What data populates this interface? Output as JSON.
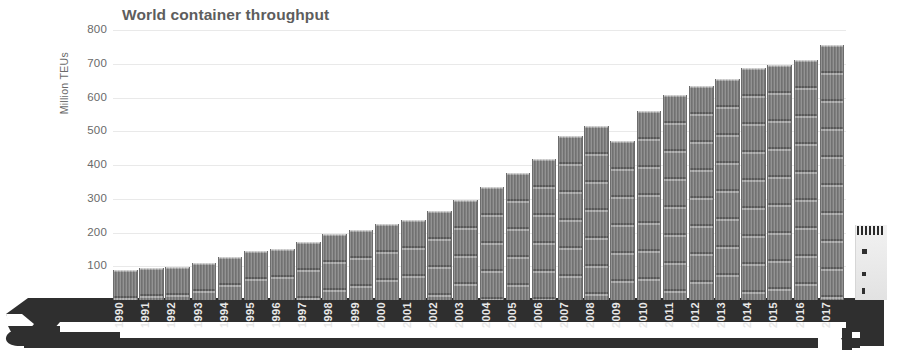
{
  "chart": {
    "title": "World container throughput",
    "ylabel": "Million TEUs"
  },
  "chart_data": {
    "type": "bar",
    "title": "World container throughput",
    "xlabel": "",
    "ylabel": "Million TEUs",
    "ylim": [
      0,
      800
    ],
    "ytick_labels": [
      "100",
      "200",
      "300",
      "400",
      "500",
      "600",
      "700",
      "800"
    ],
    "yticks": [
      100,
      200,
      300,
      400,
      500,
      600,
      700,
      800
    ],
    "grid": true,
    "legend": false,
    "categories": [
      "1990",
      "1991",
      "1992",
      "1993",
      "1994",
      "1995",
      "1996",
      "1997",
      "1998",
      "1999",
      "2000",
      "2001",
      "2002",
      "2003",
      "2004",
      "2005",
      "2006",
      "2007",
      "2008",
      "2009",
      "2010",
      "2011",
      "2012",
      "2013",
      "2014",
      "2015",
      "2016",
      "2017"
    ],
    "values": [
      88,
      96,
      99,
      110,
      128,
      145,
      151,
      172,
      197,
      206,
      226,
      237,
      263,
      296,
      336,
      376,
      418,
      485,
      516,
      471,
      560,
      608,
      633,
      655,
      686,
      697,
      711,
      755
    ],
    "series": [
      {
        "name": "World container throughput",
        "values": [
          88,
          96,
          99,
          110,
          128,
          145,
          151,
          172,
          197,
          206,
          226,
          237,
          263,
          296,
          336,
          376,
          418,
          485,
          516,
          471,
          560,
          608,
          633,
          655,
          686,
          697,
          711,
          755
        ]
      }
    ],
    "annotations": []
  },
  "colors": {
    "container": "#7e7e7e",
    "hull": "#2f2f2f",
    "gridline": "#e9e9e9",
    "tick_text": "#6a6a6a",
    "title_text": "#5d5d5d",
    "xlabel_text": "#e8e8e8",
    "superstructure": "#f2f2f2",
    "background": "#ffffff"
  },
  "vessel": {
    "bow_name": "ship-bow",
    "stern_name": "ship-stern",
    "deck_name": "ship-deck",
    "superstructure_name": "ship-superstructure"
  }
}
